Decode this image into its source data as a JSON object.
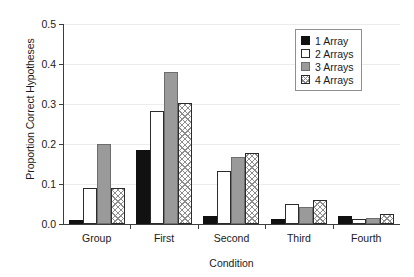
{
  "chart_data": {
    "type": "bar",
    "title": "",
    "xlabel": "Condition",
    "ylabel": "Proportion Correct Hypotheses",
    "categories": [
      "Group",
      "First",
      "Second",
      "Third",
      "Fourth"
    ],
    "series": [
      {
        "name": "1 Array",
        "color": "#111111",
        "fill": "solid-black",
        "values": [
          0.011,
          0.186,
          0.02,
          0.012,
          0.021
        ]
      },
      {
        "name": "2 Arrays",
        "color": "#ffffff",
        "fill": "open-white",
        "values": [
          0.089,
          0.283,
          0.133,
          0.05,
          0.012
        ]
      },
      {
        "name": "3 Arrays",
        "color": "#9a9a9a",
        "fill": "solid-gray",
        "values": [
          0.199,
          0.38,
          0.167,
          0.043,
          0.016
        ]
      },
      {
        "name": "4 Arrays",
        "color": "#8d8d8d",
        "fill": "crosshatch",
        "values": [
          0.089,
          0.302,
          0.178,
          0.06,
          0.024
        ]
      }
    ],
    "ylim": [
      0.0,
      0.5
    ],
    "ytick_labels": [
      "0.0",
      "0.1",
      "0.2",
      "0.3",
      "0.4",
      "0.5"
    ],
    "ytick_values": [
      0.0,
      0.1,
      0.2,
      0.3,
      0.4,
      0.5
    ],
    "grid": true,
    "grid_axis": "y",
    "legend_position": "top-right",
    "legend_entries": [
      "1 Array",
      "2 Arrays",
      "3 Arrays",
      "4 Arrays"
    ]
  }
}
